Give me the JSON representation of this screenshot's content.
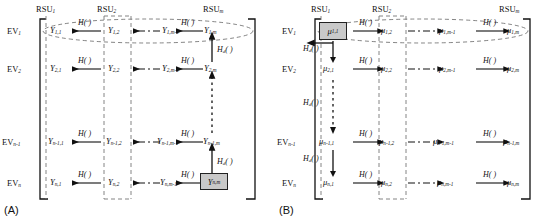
{
  "figure": {
    "caption_a": "(A)",
    "caption_b": "(B)",
    "accent_shade": "#c9c9c9",
    "line_color": "#111111"
  },
  "panel_a": {
    "tag": "(A)",
    "column_headers": [
      {
        "name": "RSU",
        "sub": "1"
      },
      {
        "name": "RSU",
        "sub": "2"
      },
      {
        "name": "RSU",
        "sub": "m"
      }
    ],
    "row_headers": [
      {
        "name": "EV",
        "sub": "1"
      },
      {
        "name": "EV",
        "sub": "2"
      },
      {
        "name": "EV",
        "sub": "n-1"
      },
      {
        "name": "EV",
        "sub": "n"
      }
    ],
    "symbol": "Y",
    "nodes": [
      [
        {
          "sym": "Y",
          "sub": "1,1"
        },
        {
          "sym": "Y",
          "sub": "1,2"
        },
        {
          "sym": "Y",
          "sub": "1,m-1"
        },
        {
          "sym": "Y",
          "sub": "1,m"
        }
      ],
      [
        {
          "sym": "Y",
          "sub": "2,1"
        },
        {
          "sym": "Y",
          "sub": "2,2"
        },
        {
          "sym": "Y",
          "sub": "2,m-1"
        },
        {
          "sym": "Y",
          "sub": "2,m"
        }
      ],
      [
        {
          "sym": "Y",
          "sub": "n-1,1"
        },
        {
          "sym": "Y",
          "sub": "n-1,2"
        },
        {
          "sym": "Y",
          "sub": "n-1,m-1"
        },
        {
          "sym": "Y",
          "sub": "n-1,m"
        }
      ],
      [
        {
          "sym": "Y",
          "sub": "n,1"
        },
        {
          "sym": "Y",
          "sub": "n,2"
        },
        {
          "sym": "Y",
          "sub": "n,m-1"
        },
        {
          "sym": "Y",
          "sub": "n,m"
        }
      ]
    ],
    "highlighted_node": {
      "sym": "Y",
      "sub": "n,m"
    },
    "highlighted_position": "bottom-right",
    "h_label": "H( )",
    "hd_label": "H",
    "hd_sub": "d",
    "hd_label_full": "H( )",
    "horizontal_direction": "right-to-left",
    "vertical_direction": "bottom-to-top",
    "ellipse_row": 1
  },
  "panel_b": {
    "tag": "(B)",
    "column_headers": [
      {
        "name": "RSU",
        "sub": "1"
      },
      {
        "name": "RSU",
        "sub": "2"
      },
      {
        "name": "RSU",
        "sub": "m"
      }
    ],
    "row_headers": [
      {
        "name": "EV",
        "sub": "1"
      },
      {
        "name": "EV",
        "sub": "2"
      },
      {
        "name": "EV",
        "sub": "n-1"
      },
      {
        "name": "EV",
        "sub": "n"
      }
    ],
    "symbol": "μ",
    "nodes": [
      [
        {
          "sym": "μ",
          "sub": "1,1"
        },
        {
          "sym": "μ",
          "sub": "1,2"
        },
        {
          "sym": "μ",
          "sub": "1,m-1"
        },
        {
          "sym": "μ",
          "sub": "1,m"
        }
      ],
      [
        {
          "sym": "μ",
          "sub": "2,1"
        },
        {
          "sym": "μ",
          "sub": "2,2"
        },
        {
          "sym": "μ",
          "sub": "2,m-1"
        },
        {
          "sym": "μ",
          "sub": "2,m"
        }
      ],
      [
        {
          "sym": "μ",
          "sub": "n-1,1"
        },
        {
          "sym": "μ",
          "sub": "n-1,2"
        },
        {
          "sym": "μ",
          "sub": "n-1,m-1"
        },
        {
          "sym": "μ",
          "sub": "n-1,m"
        }
      ],
      [
        {
          "sym": "μ",
          "sub": "n,1"
        },
        {
          "sym": "μ",
          "sub": "n,2"
        },
        {
          "sym": "μ",
          "sub": "n,m-1"
        },
        {
          "sym": "μ",
          "sub": "n,m"
        }
      ]
    ],
    "highlighted_node": {
      "sym": "μ",
      "sub": "1,1"
    },
    "highlighted_position": "top-left",
    "h_label": "H( )",
    "hd_label": "H",
    "hd_sub": "d",
    "horizontal_direction": "left-to-right",
    "vertical_direction": "top-to-bottom",
    "ellipse_row": 1
  },
  "labels": {
    "h": "H( )",
    "hd_base": "H",
    "hd_sub": "d",
    "hd_tail": "( )",
    "rsu": "RSU",
    "ev": "EV"
  }
}
